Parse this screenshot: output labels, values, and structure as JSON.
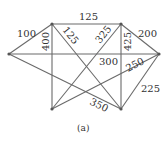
{
  "diagram": {
    "type": "weighted-graph",
    "caption": "(a)",
    "nodes": [
      {
        "id": "A",
        "x": 52,
        "y": 24
      },
      {
        "id": "B",
        "x": 121,
        "y": 24
      },
      {
        "id": "C",
        "x": 9,
        "y": 54
      },
      {
        "id": "D",
        "x": 159,
        "y": 54
      },
      {
        "id": "E",
        "x": 52,
        "y": 109
      },
      {
        "id": "F",
        "x": 121,
        "y": 109
      }
    ],
    "edges": [
      {
        "from": "A",
        "to": "B",
        "weight": "125"
      },
      {
        "from": "C",
        "to": "A",
        "weight": "100"
      },
      {
        "from": "B",
        "to": "D",
        "weight": "200"
      },
      {
        "from": "A",
        "to": "E",
        "weight": "400"
      },
      {
        "from": "A",
        "to": "F",
        "weight": "125"
      },
      {
        "from": "B",
        "to": "E",
        "weight": "325"
      },
      {
        "from": "B",
        "to": "F",
        "weight": "425"
      },
      {
        "from": "C",
        "to": "D",
        "weight": "300"
      },
      {
        "from": "E",
        "to": "D",
        "weight": "250"
      },
      {
        "from": "F",
        "to": "D",
        "weight": "225"
      },
      {
        "from": "C",
        "to": "F",
        "weight": "350"
      }
    ]
  }
}
